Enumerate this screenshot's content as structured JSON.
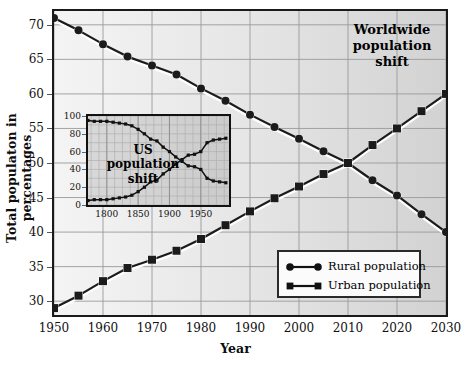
{
  "chart_data": {
    "type": "line",
    "title": "Worldwide population shift",
    "xlabel": "Year",
    "ylabel": "Total populaton in percentages",
    "xlim": [
      1950,
      2030
    ],
    "ylim": [
      28,
      72
    ],
    "grid": true,
    "legend_position": "bottom-right",
    "x": [
      1950,
      1955,
      1960,
      1965,
      1970,
      1975,
      1980,
      1985,
      1990,
      1995,
      2000,
      2005,
      2010,
      2015,
      2020,
      2025,
      2030
    ],
    "xticks": [
      "1950",
      "1960",
      "1970",
      "1980",
      "1990",
      "2000",
      "2010",
      "2020",
      "2030"
    ],
    "yticks": [
      "30",
      "35",
      "40",
      "45",
      "50",
      "55",
      "60",
      "65",
      "70"
    ],
    "series": [
      {
        "name": "Rural population",
        "marker": "circle",
        "values": [
          71.0,
          69.2,
          67.2,
          65.4,
          64.1,
          62.8,
          60.8,
          59.0,
          57.0,
          55.2,
          53.5,
          51.7,
          50.0,
          47.5,
          45.3,
          42.6,
          40.0
        ]
      },
      {
        "name": "Urban population",
        "marker": "square",
        "values": [
          29.0,
          30.8,
          32.9,
          34.8,
          36.0,
          37.3,
          39.0,
          41.0,
          43.0,
          44.9,
          46.6,
          48.4,
          50.0,
          52.6,
          55.0,
          57.5,
          60.0
        ]
      }
    ],
    "inset": {
      "type": "line",
      "title": "US population shift",
      "xlim": [
        1770,
        1995
      ],
      "ylim": [
        0,
        100
      ],
      "grid": true,
      "xticks": [
        "1800",
        "1850",
        "1900",
        "1950"
      ],
      "yticks": [
        "0",
        "20",
        "40",
        "60",
        "80",
        "100"
      ],
      "x": [
        1770,
        1780,
        1790,
        1800,
        1810,
        1820,
        1830,
        1840,
        1850,
        1860,
        1870,
        1880,
        1890,
        1900,
        1910,
        1920,
        1930,
        1940,
        1950,
        1960,
        1970,
        1980,
        1990
      ],
      "series": [
        {
          "name": "Rural population",
          "marker": "dot",
          "values": [
            95,
            94,
            94,
            94,
            93,
            92,
            91,
            89,
            85,
            80,
            74,
            72,
            65,
            60,
            54,
            49,
            44,
            43,
            40,
            30,
            27,
            26,
            25
          ]
        },
        {
          "name": "Urban population",
          "marker": "dot",
          "values": [
            5,
            6,
            6,
            6,
            7,
            8,
            9,
            11,
            15,
            20,
            26,
            28,
            35,
            40,
            46,
            51,
            56,
            57,
            60,
            70,
            73,
            74,
            75
          ]
        }
      ]
    }
  },
  "legend": {
    "items": [
      {
        "label": "Rural population",
        "marker": "circle"
      },
      {
        "label": "Urban population",
        "marker": "square"
      }
    ]
  },
  "titles": {
    "main_line1": "Worldwide",
    "main_line2": "population",
    "main_line3": "shift",
    "inset_line1": "US",
    "inset_line2": "population",
    "inset_line3": "shift"
  }
}
